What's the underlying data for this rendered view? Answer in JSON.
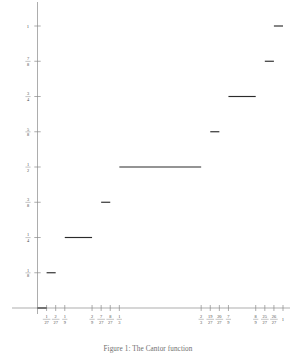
{
  "figure": {
    "caption": "Figure 1: The Cantor function",
    "line_color": "#2b2b2b",
    "axis_color": "#8a8a8a",
    "background": "#ffffff"
  },
  "chart_data": {
    "type": "line",
    "title": "",
    "subtitle": "",
    "xlabel": "",
    "ylabel": "",
    "xlim": [
      0,
      1
    ],
    "ylim": [
      0,
      1
    ],
    "grid": false,
    "legend": null,
    "x_ticks": [
      {
        "value": 0.037037,
        "num": "1",
        "den": "27"
      },
      {
        "value": 0.074074,
        "num": "2",
        "den": "27"
      },
      {
        "value": 0.111111,
        "num": "1",
        "den": "9"
      },
      {
        "value": 0.222222,
        "num": "2",
        "den": "9"
      },
      {
        "value": 0.259259,
        "num": "7",
        "den": "27"
      },
      {
        "value": 0.296296,
        "num": "8",
        "den": "27"
      },
      {
        "value": 0.333333,
        "num": "1",
        "den": "3"
      },
      {
        "value": 0.666667,
        "num": "2",
        "den": "3"
      },
      {
        "value": 0.703704,
        "num": "19",
        "den": "27"
      },
      {
        "value": 0.740741,
        "num": "20",
        "den": "27"
      },
      {
        "value": 0.777778,
        "num": "7",
        "den": "9"
      },
      {
        "value": 0.888889,
        "num": "8",
        "den": "9"
      },
      {
        "value": 0.925926,
        "num": "25",
        "den": "27"
      },
      {
        "value": 0.962963,
        "num": "26",
        "den": "27"
      },
      {
        "value": 1.0,
        "num": "1",
        "den": ""
      }
    ],
    "y_ticks": [
      {
        "value": 1.0,
        "num": "1",
        "den": ""
      },
      {
        "value": 0.875,
        "num": "7",
        "den": "8"
      },
      {
        "value": 0.75,
        "num": "3",
        "den": "4"
      },
      {
        "value": 0.625,
        "num": "5",
        "den": "8"
      },
      {
        "value": 0.5,
        "num": "1",
        "den": "2"
      },
      {
        "value": 0.375,
        "num": "3",
        "den": "8"
      },
      {
        "value": 0.25,
        "num": "1",
        "den": "4"
      },
      {
        "value": 0.125,
        "num": "1",
        "den": "8"
      }
    ],
    "segments": [
      {
        "x0": 0.0,
        "x1": 0.037037,
        "y": 0.0
      },
      {
        "x0": 0.037037,
        "x1": 0.074074,
        "y": 0.125
      },
      {
        "x0": 0.111111,
        "x1": 0.222222,
        "y": 0.25
      },
      {
        "x0": 0.259259,
        "x1": 0.296296,
        "y": 0.375
      },
      {
        "x0": 0.333333,
        "x1": 0.666667,
        "y": 0.5
      },
      {
        "x0": 0.703704,
        "x1": 0.740741,
        "y": 0.625
      },
      {
        "x0": 0.777778,
        "x1": 0.888889,
        "y": 0.75
      },
      {
        "x0": 0.925926,
        "x1": 0.962963,
        "y": 0.875
      },
      {
        "x0": 0.962963,
        "x1": 1.0,
        "y": 1.0
      }
    ]
  }
}
